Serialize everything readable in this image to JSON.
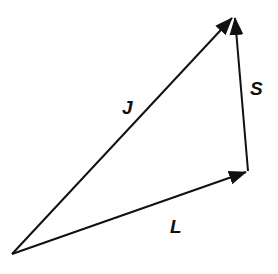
{
  "diagram": {
    "type": "vector-addition",
    "colors": {
      "stroke": "#111111",
      "background": "#ffffff"
    },
    "vectors": [
      {
        "name": "J",
        "label": "J",
        "from": [
          12,
          254
        ],
        "to": [
          232,
          18
        ],
        "label_pos": [
          122,
          114
        ]
      },
      {
        "name": "L",
        "label": "L",
        "from": [
          12,
          254
        ],
        "to": [
          246,
          172
        ],
        "label_pos": [
          170,
          233
        ]
      },
      {
        "name": "S",
        "label": "S",
        "from": [
          248,
          171
        ],
        "to": [
          235,
          18
        ],
        "label_pos": [
          250,
          95
        ]
      }
    ],
    "relation": "J = L + S"
  }
}
